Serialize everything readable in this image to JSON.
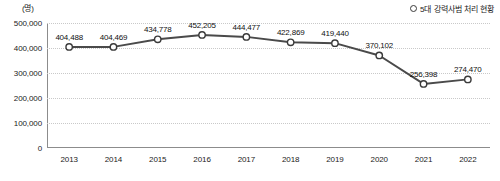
{
  "chart_data": {
    "type": "line",
    "title": "",
    "unit_label": "(명)",
    "legend": [
      {
        "name": "5대 강력사범 처리 현황",
        "marker": "open-circle"
      }
    ],
    "legend_position": "top-right",
    "grid": true,
    "xlabel": "",
    "ylabel": "",
    "categories": [
      "2013",
      "2014",
      "2015",
      "2016",
      "2017",
      "2018",
      "2019",
      "2020",
      "2021",
      "2022"
    ],
    "values": [
      404488,
      404469,
      434778,
      452205,
      444477,
      422869,
      419440,
      370102,
      256398,
      274470
    ],
    "value_labels": [
      "404,488",
      "404,469",
      "434,778",
      "452,205",
      "444,477",
      "422,869",
      "419,440",
      "370,102",
      "256,398",
      "274,470"
    ],
    "ylim": [
      0,
      500000
    ],
    "yticks": [
      0,
      100000,
      200000,
      300000,
      400000,
      500000
    ],
    "ytick_labels": [
      "0",
      "100,000",
      "200,000",
      "300,000",
      "400,000",
      "500,000"
    ],
    "series_color": "#4a4a4a",
    "marker_fill": "#ffffff",
    "marker_stroke": "#3a3a3a",
    "grid_color": "#c9c9c9",
    "axis_color": "#8c8c8c"
  }
}
